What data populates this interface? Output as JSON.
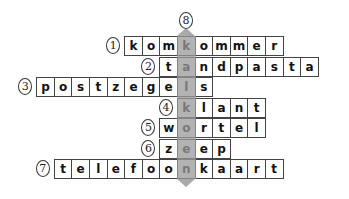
{
  "puzzle": {
    "type": "crossword",
    "solution_column_number": "8",
    "solution_word": "kalkoen",
    "shade_color": "#9a9a9a",
    "rows": [
      {
        "number": "1",
        "word": "komkommer",
        "letters": [
          "k",
          "o",
          "m",
          "k",
          "o",
          "m",
          "m",
          "e",
          "r"
        ],
        "shaded_index": 3
      },
      {
        "number": "2",
        "word": "tandpasta",
        "letters": [
          "t",
          "a",
          "n",
          "d",
          "p",
          "a",
          "s",
          "t",
          "a"
        ],
        "shaded_index": 1
      },
      {
        "number": "3",
        "word": "postzegels",
        "letters": [
          "p",
          "o",
          "s",
          "t",
          "z",
          "e",
          "g",
          "e",
          "l",
          "s"
        ],
        "shaded_index": 8
      },
      {
        "number": "4",
        "word": "klant",
        "letters": [
          "k",
          "l",
          "a",
          "n",
          "t"
        ],
        "shaded_index": 0
      },
      {
        "number": "5",
        "word": "wortel",
        "letters": [
          "w",
          "o",
          "r",
          "t",
          "e",
          "l"
        ],
        "shaded_index": 1
      },
      {
        "number": "6",
        "word": "zeep",
        "letters": [
          "z",
          "e",
          "e",
          "p"
        ],
        "shaded_index": 1
      },
      {
        "number": "7",
        "word": "telefoonkaart",
        "letters": [
          "t",
          "e",
          "l",
          "e",
          "f",
          "o",
          "o",
          "n",
          "k",
          "a",
          "a",
          "r",
          "t"
        ],
        "shaded_index": 7
      }
    ]
  }
}
